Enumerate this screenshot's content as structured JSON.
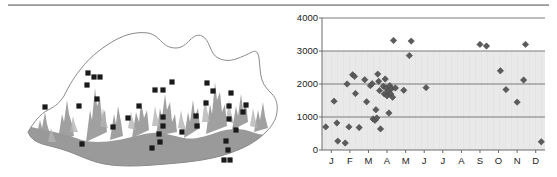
{
  "figure": {
    "title": "",
    "panels": [
      "distribution-map",
      "elevation-by-month-scatter"
    ]
  },
  "map": {
    "name": "Bhutan relief map with collection localities",
    "region_label": "Bhutan",
    "marker_symbol": "filled-square",
    "marker_color": "#1a1a1a",
    "lowland_shade_color": "#9a9a9a",
    "highland_shade_color": "#ffffff",
    "outline_color": "#8a8a8a",
    "marker_count": 35,
    "markers": [
      {
        "x": 45,
        "y": 93
      },
      {
        "x": 79,
        "y": 92
      },
      {
        "x": 88,
        "y": 59
      },
      {
        "x": 94,
        "y": 63
      },
      {
        "x": 100,
        "y": 63
      },
      {
        "x": 97,
        "y": 85
      },
      {
        "x": 87,
        "y": 71
      },
      {
        "x": 113,
        "y": 113
      },
      {
        "x": 82,
        "y": 130
      },
      {
        "x": 128,
        "y": 104
      },
      {
        "x": 152,
        "y": 134
      },
      {
        "x": 155,
        "y": 76
      },
      {
        "x": 163,
        "y": 76
      },
      {
        "x": 172,
        "y": 68
      },
      {
        "x": 163,
        "y": 103
      },
      {
        "x": 163,
        "y": 112
      },
      {
        "x": 159,
        "y": 120
      },
      {
        "x": 160,
        "y": 128
      },
      {
        "x": 196,
        "y": 102
      },
      {
        "x": 197,
        "y": 112
      },
      {
        "x": 207,
        "y": 69
      },
      {
        "x": 213,
        "y": 77
      },
      {
        "x": 229,
        "y": 105
      },
      {
        "x": 231,
        "y": 79
      },
      {
        "x": 236,
        "y": 116
      },
      {
        "x": 226,
        "y": 127
      },
      {
        "x": 228,
        "y": 136
      },
      {
        "x": 224,
        "y": 146
      },
      {
        "x": 230,
        "y": 146
      },
      {
        "x": 229,
        "y": 92
      },
      {
        "x": 243,
        "y": 98
      },
      {
        "x": 246,
        "y": 91
      },
      {
        "x": 206,
        "y": 89
      },
      {
        "x": 182,
        "y": 118
      },
      {
        "x": 139,
        "y": 92
      }
    ]
  },
  "chart_data": {
    "type": "scatter",
    "title": "",
    "xlabel": "",
    "ylabel": "",
    "categories": [
      "J",
      "F",
      "M",
      "A",
      "M",
      "J",
      "J",
      "A",
      "S",
      "O",
      "N",
      "D"
    ],
    "xtick_labels": [
      "J",
      "F",
      "M",
      "A",
      "M",
      "J",
      "J",
      "A",
      "S",
      "O",
      "N",
      "D"
    ],
    "ytick_labels": [
      "0",
      "1000",
      "2000",
      "3000",
      "4000"
    ],
    "ytick_values": [
      0,
      1000,
      2000,
      3000,
      4000
    ],
    "ylim": [
      0,
      4000
    ],
    "xlim": [
      0.5,
      12.5
    ],
    "grid": "horizontal",
    "legend": "none",
    "marker": "diamond",
    "marker_color": "#5b5b5b",
    "series": [
      {
        "name": "collection records",
        "points": [
          {
            "month": "J",
            "x": 0.7,
            "y": 700
          },
          {
            "month": "J",
            "x": 1.15,
            "y": 1480
          },
          {
            "month": "J",
            "x": 1.3,
            "y": 820
          },
          {
            "month": "J",
            "x": 1.35,
            "y": 270
          },
          {
            "month": "F",
            "x": 1.75,
            "y": 210
          },
          {
            "month": "F",
            "x": 1.85,
            "y": 2000
          },
          {
            "month": "F",
            "x": 1.95,
            "y": 700
          },
          {
            "month": "F",
            "x": 2.15,
            "y": 2280
          },
          {
            "month": "F",
            "x": 2.25,
            "y": 2230
          },
          {
            "month": "F",
            "x": 2.3,
            "y": 1710
          },
          {
            "month": "F",
            "x": 2.5,
            "y": 680
          },
          {
            "month": "M",
            "x": 2.8,
            "y": 2130
          },
          {
            "month": "M",
            "x": 2.9,
            "y": 1460
          },
          {
            "month": "M",
            "x": 3.1,
            "y": 1950
          },
          {
            "month": "M",
            "x": 3.2,
            "y": 2010
          },
          {
            "month": "M",
            "x": 3.25,
            "y": 940
          },
          {
            "month": "M",
            "x": 3.35,
            "y": 900
          },
          {
            "month": "M",
            "x": 3.4,
            "y": 1220
          },
          {
            "month": "M",
            "x": 3.45,
            "y": 970
          },
          {
            "month": "M",
            "x": 3.5,
            "y": 2300
          },
          {
            "month": "M",
            "x": 3.55,
            "y": 2080
          },
          {
            "month": "M",
            "x": 3.6,
            "y": 1800
          },
          {
            "month": "M",
            "x": 3.65,
            "y": 640
          },
          {
            "month": "A",
            "x": 3.8,
            "y": 1930
          },
          {
            "month": "A",
            "x": 3.85,
            "y": 1700
          },
          {
            "month": "A",
            "x": 3.9,
            "y": 2150
          },
          {
            "month": "A",
            "x": 3.95,
            "y": 1880
          },
          {
            "month": "A",
            "x": 4.0,
            "y": 1640
          },
          {
            "month": "A",
            "x": 4.05,
            "y": 1790
          },
          {
            "month": "A",
            "x": 4.1,
            "y": 1120
          },
          {
            "month": "A",
            "x": 4.15,
            "y": 1950
          },
          {
            "month": "A",
            "x": 4.2,
            "y": 1700
          },
          {
            "month": "A",
            "x": 4.25,
            "y": 1860
          },
          {
            "month": "A",
            "x": 4.3,
            "y": 1600
          },
          {
            "month": "A",
            "x": 4.35,
            "y": 3320
          },
          {
            "month": "A",
            "x": 4.45,
            "y": 1880
          },
          {
            "month": "M",
            "x": 4.9,
            "y": 1810
          },
          {
            "month": "M",
            "x": 5.3,
            "y": 3300
          },
          {
            "month": "M",
            "x": 5.2,
            "y": 2860
          },
          {
            "month": "J",
            "x": 6.1,
            "y": 1890
          },
          {
            "month": "S",
            "x": 9.0,
            "y": 3200
          },
          {
            "month": "S",
            "x": 9.35,
            "y": 3150
          },
          {
            "month": "O",
            "x": 10.1,
            "y": 2400
          },
          {
            "month": "O",
            "x": 10.4,
            "y": 1830
          },
          {
            "month": "N",
            "x": 11.0,
            "y": 1450
          },
          {
            "month": "N",
            "x": 11.35,
            "y": 2120
          },
          {
            "month": "N",
            "x": 11.45,
            "y": 3200
          },
          {
            "month": "D",
            "x": 12.3,
            "y": 250
          }
        ]
      }
    ]
  }
}
